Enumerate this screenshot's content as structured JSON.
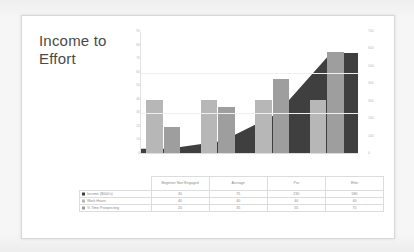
{
  "slide": {
    "title": "Income to\nEffort",
    "title_line1": "Income to",
    "title_line2": "Effort"
  },
  "colors": {
    "income_area": "#3f3f3f",
    "work_hours_bar": "#b7b7b7",
    "prospecting_bar": "#9e9e9e",
    "slide_background": "#ffffff",
    "page_background": "#f2f2f2",
    "axis_text": "#b9b9b9",
    "table_text": "#8a8a8a",
    "gridline": "#efefef"
  },
  "chart_data": {
    "type": "bar",
    "title": "Income to Effort",
    "xlabel": "",
    "ylabel": "",
    "grid": true,
    "legend_position": "data-table",
    "categories": [
      "Beginner Non Engaged",
      "Average",
      "Pro",
      "Elite"
    ],
    "series": [
      {
        "name": "Income ($000's)",
        "render": "area",
        "axis": "right",
        "color": "#3f3f3f",
        "values": [
          30,
          75,
          230,
          580
        ]
      },
      {
        "name": "Work Hours",
        "render": "bar",
        "axis": "left",
        "color": "#b7b7b7",
        "values": [
          40,
          40,
          40,
          40
        ]
      },
      {
        "name": "% Time Prospecting",
        "render": "bar",
        "axis": "left",
        "color": "#9e9e9e",
        "values": [
          20,
          35,
          55,
          75
        ]
      }
    ],
    "left_axis": {
      "label": "",
      "ylim": [
        0,
        90
      ],
      "ticks": [
        "90",
        "80",
        "70",
        "60",
        "50",
        "40",
        "30",
        "20",
        "10",
        "0"
      ]
    },
    "right_axis": {
      "label": "",
      "ylim": [
        0,
        700
      ],
      "ticks": [
        "700",
        "600",
        "500",
        "400",
        "300",
        "200",
        "100",
        "0"
      ]
    }
  },
  "table": {
    "corner": "",
    "headers": [
      "Beginner Non Engaged",
      "Average",
      "Pro",
      "Elite"
    ],
    "rows": [
      {
        "label": "Income ($000's)",
        "swatch": "income",
        "values": [
          "30",
          "75",
          "230",
          "580"
        ]
      },
      {
        "label": "Work Hours",
        "swatch": "work",
        "values": [
          "40",
          "40",
          "40",
          "40"
        ]
      },
      {
        "label": "% Time Prospecting",
        "swatch": "prospect",
        "values": [
          "20",
          "35",
          "55",
          "75"
        ]
      }
    ]
  }
}
